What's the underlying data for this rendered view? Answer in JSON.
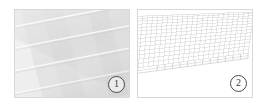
{
  "figure": {
    "background_color": "#ffffff",
    "width": 265,
    "height": 104,
    "panel_border_color": "#d8d8d8"
  },
  "panels": [
    {
      "id": "photo",
      "index_label": "1",
      "kind": "photograph",
      "description": "Grayscale close-up photograph of a ribbed / corrugated sheet surface seen at an oblique angle, showing fine diagonal striations and brighter diagonal seam bands.",
      "base_color": "#e9e9e9",
      "stripe_color": "#d2d2d2",
      "seam_color": "#fafafa",
      "shadow_color": "#c9c9c9",
      "stripe_angle_deg": -28,
      "seam_count": 4
    },
    {
      "id": "mesh",
      "index_label": "2",
      "kind": "wireframe-mesh",
      "description": "Perspective wireframe finite-element mesh of the same corrugated plate, drawn as thin gray lines on a white background with the plate thickness visible along the lower-right free edge.",
      "line_color": "#b9bcc2",
      "edge_color": "#9aa0a8",
      "background_color": "#ffffff",
      "rows": 14,
      "columns": 26,
      "thickness_elements": 12
    }
  ],
  "badges": {
    "panel_1": "1",
    "panel_2": "2",
    "border_color": "#4a4a4a",
    "text_color": "#3a3a3a"
  }
}
